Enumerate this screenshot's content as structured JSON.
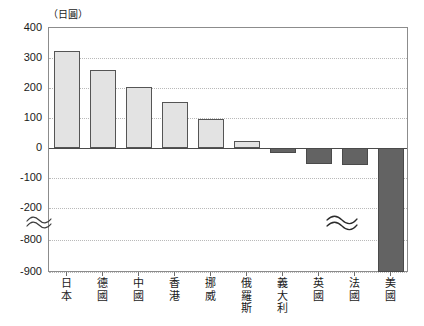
{
  "chart_data": {
    "type": "bar",
    "title": "",
    "subtitle": "",
    "unit_label": "（日圓）",
    "xlabel": "",
    "ylabel": "",
    "categories": [
      "日本",
      "德國",
      "中國",
      "香港",
      "挪威",
      "俄羅斯",
      "義大利",
      "英國",
      "法國",
      "美國"
    ],
    "values": [
      325,
      260,
      202,
      155,
      97,
      25,
      -18,
      -52,
      -55,
      -900
    ],
    "series": [
      {
        "name": "",
        "values": [
          325,
          260,
          202,
          155,
          97,
          25,
          -18,
          -52,
          -55,
          -900
        ]
      }
    ],
    "ytick_labels": [
      "400",
      "300",
      "200",
      "100",
      "0",
      "-100",
      "-200",
      "-800",
      "-900"
    ],
    "ytick_values": [
      400,
      300,
      200,
      100,
      0,
      -100,
      -200,
      -800,
      -900
    ],
    "ylim": [
      -900,
      400
    ],
    "axis_break": {
      "present": true,
      "between": [
        -200,
        -800
      ],
      "symbol": "≈"
    },
    "grid": "horizontal-dotted",
    "legend": "none",
    "colors": {
      "positive_bar_fill": "#e3e3e3",
      "positive_bar_border": "#555555",
      "negative_bar_fill": "#636363",
      "negative_bar_border": "#4a4a4a",
      "gridline": "#b9b9b9",
      "axis": "#8c8c8c",
      "zero_line": "#4a4a4a",
      "text": "#1a1a1a"
    },
    "bar_break_category": "美國"
  }
}
